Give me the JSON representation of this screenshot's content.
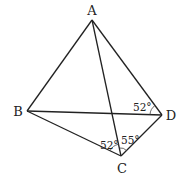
{
  "figure": {
    "type": "geometry",
    "points": [
      {
        "label": "A",
        "x": 92,
        "y": 20,
        "lx": 92,
        "ly": 15
      },
      {
        "label": "B",
        "x": 27,
        "y": 111,
        "lx": 18,
        "ly": 116
      },
      {
        "label": "D",
        "x": 162,
        "y": 115,
        "lx": 171,
        "ly": 120
      },
      {
        "label": "C",
        "x": 121,
        "y": 156,
        "lx": 122,
        "ly": 173
      }
    ],
    "segments": [
      "AB",
      "AD",
      "AC",
      "BD",
      "BC",
      "CD"
    ],
    "angles": [
      {
        "label": "52°",
        "at": "D",
        "between": "ADB"
      },
      {
        "label": "52°",
        "at": "C",
        "between": "BCA"
      },
      {
        "label": "55°",
        "at": "C",
        "between": "ACD"
      }
    ]
  }
}
